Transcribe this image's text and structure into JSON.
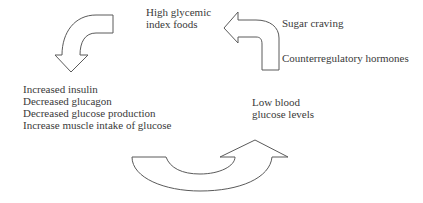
{
  "diagram": {
    "nodes": {
      "high_gi_foods": {
        "lines": [
          "High glycemic",
          "index foods"
        ]
      },
      "insulin_response": {
        "lines": [
          "Increased insulin",
          "Decreased glucagon",
          "Decreased glucose production",
          "Increase muscle intake of glucose"
        ]
      },
      "low_glucose": {
        "lines": [
          "Low blood",
          "glucose levels"
        ]
      },
      "sugar_craving": {
        "text": "Sugar craving"
      },
      "counterregulatory": {
        "text": "Counterregulatory hormones"
      }
    },
    "arrows": [
      {
        "name": "foods-to-insulin-arrow",
        "direction": "curved-down-left"
      },
      {
        "name": "insulin-to-low-glucose-arrow",
        "direction": "curved-up-right"
      },
      {
        "name": "low-glucose-to-foods-arrow",
        "direction": "curved-up-left"
      }
    ],
    "colors": {
      "stroke": "#5a5a5a",
      "text": "#3a3a3a",
      "background": "#ffffff"
    }
  }
}
